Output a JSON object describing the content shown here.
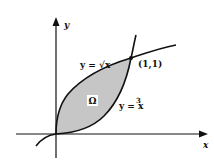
{
  "diagram": {
    "type": "region-between-curves",
    "axes": {
      "x_label": "x",
      "y_label": "y"
    },
    "curves": [
      {
        "name": "sqrt",
        "label": "y = √x"
      },
      {
        "name": "cubic",
        "label": "y = x",
        "exponent": "3"
      }
    ],
    "intersection_point": {
      "label": "(1,1)"
    },
    "region": {
      "label": "Ω",
      "fill": "#c8c8c8"
    },
    "colors": {
      "stroke": "#111111",
      "background": "#ffffff"
    }
  }
}
